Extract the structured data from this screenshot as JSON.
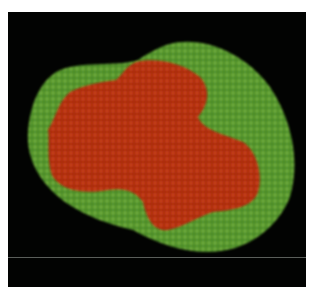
{
  "image": {
    "subject": "fluorescence micrograph of a cell cluster",
    "background_color": "#020302",
    "outer_region_color": "#4f8f2a",
    "inner_region_color": "#b5300f",
    "divider_line_color": "#5a5e5a"
  }
}
